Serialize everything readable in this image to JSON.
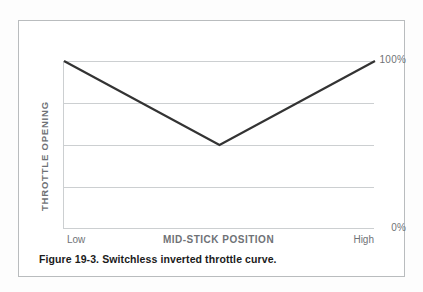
{
  "figure": {
    "caption": "Figure 19-3. Switchless inverted throttle curve."
  },
  "chart_data": {
    "type": "line",
    "title": "",
    "xlabel": "MID-STICK POSITION",
    "ylabel": "THROTTLE OPENING",
    "x": [
      0,
      50,
      100
    ],
    "values": [
      100,
      50,
      100
    ],
    "series": [
      {
        "name": "Throttle curve",
        "values": [
          100,
          50,
          100
        ]
      }
    ],
    "xlim": [
      0,
      100
    ],
    "ylim": [
      0,
      100
    ],
    "x_tick_labels": [
      "Low",
      "High"
    ],
    "y_tick_labels": [
      "100%",
      "0%"
    ],
    "y_ticks": [
      0,
      100
    ],
    "gridlines": [
      0,
      25,
      50,
      75,
      100
    ],
    "grid": true,
    "legend": "none",
    "line_color": "#333333",
    "grid_color": "#cccfd1",
    "axis_label_color": "#6f7276"
  },
  "axes": {
    "y_top_label": "100%",
    "y_bottom_label": "0%",
    "y_title": "THROTTLE OPENING",
    "x_left_label": "Low",
    "x_center_label": "MID-STICK POSITION",
    "x_right_label": "High"
  }
}
